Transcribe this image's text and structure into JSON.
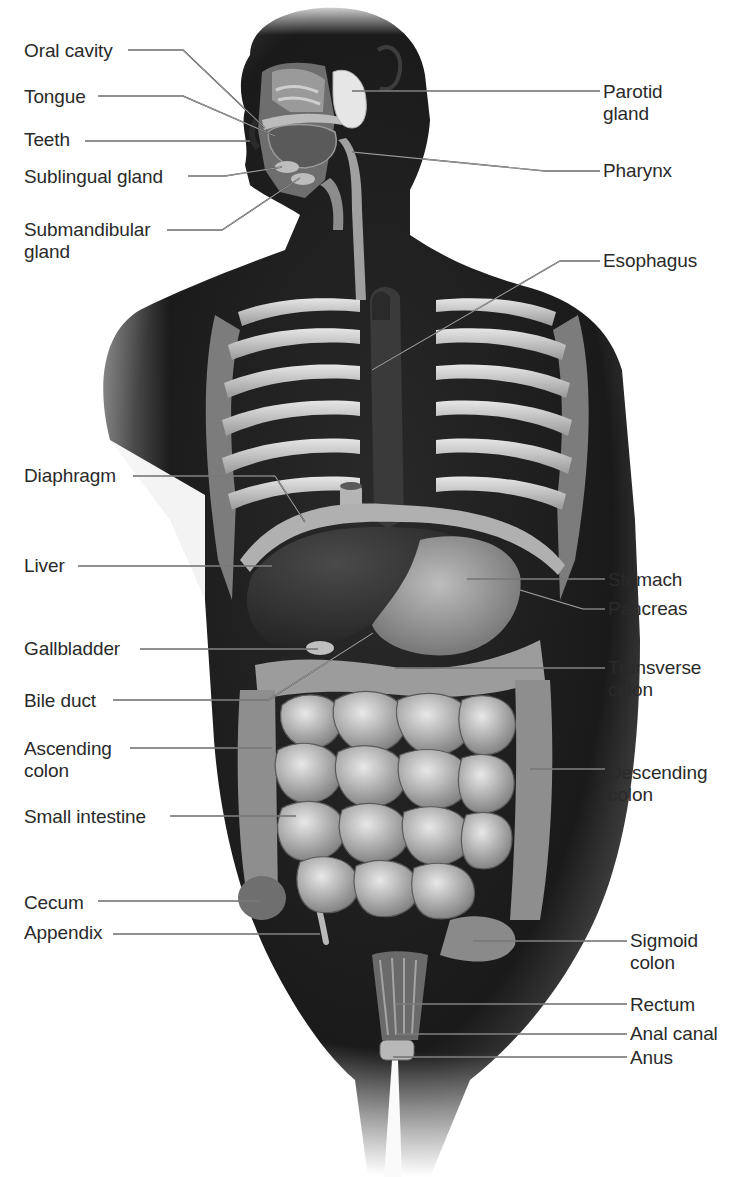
{
  "figure": {
    "colors": {
      "background": "#ffffff",
      "body": "#1c1c1c",
      "organ_light": "#c8c8c8",
      "organ_mid": "#8a8a8a",
      "label_text": "#2a2a2a",
      "leader": "#3a3a3a"
    }
  },
  "labels": [
    {
      "id": "oral-cavity",
      "text": "Oral cavity",
      "x": 24,
      "y": 40,
      "side": "left",
      "anchor": [
        128,
        50
      ],
      "path": [
        [
          128,
          50
        ],
        [
          183,
          50
        ],
        [
          265,
          128
        ]
      ]
    },
    {
      "id": "tongue",
      "text": "Tongue",
      "x": 24,
      "y": 86,
      "side": "left",
      "anchor": [
        98,
        96
      ],
      "path": [
        [
          98,
          96
        ],
        [
          183,
          96
        ],
        [
          275,
          136
        ]
      ]
    },
    {
      "id": "teeth",
      "text": "Teeth",
      "x": 24,
      "y": 129,
      "side": "left",
      "anchor": [
        85,
        141
      ],
      "path": [
        [
          85,
          141
        ],
        [
          250,
          141
        ]
      ]
    },
    {
      "id": "sublingual-gland",
      "text": "Sublingual gland",
      "x": 24,
      "y": 166,
      "side": "left",
      "anchor": [
        188,
        176
      ],
      "path": [
        [
          188,
          176
        ],
        [
          225,
          176
        ],
        [
          282,
          167
        ]
      ]
    },
    {
      "id": "submandibular-gland",
      "text": "Submandibular\ngland",
      "x": 24,
      "y": 219,
      "side": "left",
      "anchor": [
        167,
        230
      ],
      "path": [
        [
          167,
          230
        ],
        [
          222,
          230
        ],
        [
          300,
          178
        ]
      ]
    },
    {
      "id": "parotid-gland",
      "text": "Parotid\ngland",
      "x": 603,
      "y": 81,
      "side": "right",
      "anchor": [
        600,
        91
      ],
      "path": [
        [
          600,
          91
        ],
        [
          352,
          91
        ]
      ]
    },
    {
      "id": "pharynx",
      "text": "Pharynx",
      "x": 603,
      "y": 160,
      "side": "right",
      "anchor": [
        600,
        171
      ],
      "path": [
        [
          600,
          171
        ],
        [
          545,
          171
        ],
        [
          352,
          152
        ]
      ]
    },
    {
      "id": "esophagus",
      "text": "Esophagus",
      "x": 603,
      "y": 250,
      "side": "right",
      "anchor": [
        600,
        261
      ],
      "path": [
        [
          600,
          261
        ],
        [
          560,
          261
        ],
        [
          372,
          370
        ]
      ]
    },
    {
      "id": "diaphragm",
      "text": "Diaphragm",
      "x": 24,
      "y": 465,
      "side": "left",
      "anchor": [
        133,
        476
      ],
      "path": [
        [
          133,
          476
        ],
        [
          275,
          476
        ],
        [
          305,
          522
        ]
      ]
    },
    {
      "id": "liver",
      "text": "Liver",
      "x": 24,
      "y": 555,
      "side": "left",
      "anchor": [
        78,
        566
      ],
      "path": [
        [
          78,
          566
        ],
        [
          272,
          566
        ]
      ]
    },
    {
      "id": "stomach",
      "text": "Stomach",
      "x": 608,
      "y": 569,
      "side": "right",
      "anchor": [
        605,
        579
      ],
      "path": [
        [
          605,
          579
        ],
        [
          467,
          579
        ]
      ]
    },
    {
      "id": "pancreas",
      "text": "Pancreas",
      "x": 608,
      "y": 598,
      "side": "right",
      "anchor": [
        605,
        609
      ],
      "path": [
        [
          605,
          609
        ],
        [
          583,
          609
        ],
        [
          520,
          590
        ]
      ]
    },
    {
      "id": "gallbladder",
      "text": "Gallbladder",
      "x": 24,
      "y": 638,
      "side": "left",
      "anchor": [
        140,
        649
      ],
      "path": [
        [
          140,
          649
        ],
        [
          318,
          649
        ]
      ]
    },
    {
      "id": "bile-duct",
      "text": "Bile duct",
      "x": 24,
      "y": 690,
      "side": "left",
      "anchor": [
        113,
        700
      ],
      "path": [
        [
          113,
          700
        ],
        [
          268,
          700
        ],
        [
          373,
          633
        ]
      ]
    },
    {
      "id": "transverse-colon",
      "text": "Transverse\ncolon",
      "x": 608,
      "y": 657,
      "side": "right",
      "anchor": [
        605,
        668
      ],
      "path": [
        [
          605,
          668
        ],
        [
          395,
          668
        ]
      ]
    },
    {
      "id": "ascending-colon",
      "text": "Ascending\ncolon",
      "x": 24,
      "y": 738,
      "side": "left",
      "anchor": [
        130,
        748
      ],
      "path": [
        [
          130,
          748
        ],
        [
          272,
          748
        ]
      ]
    },
    {
      "id": "descending-colon",
      "text": "Descending\ncolon",
      "x": 608,
      "y": 762,
      "side": "right",
      "anchor": [
        605,
        769
      ],
      "path": [
        [
          605,
          769
        ],
        [
          530,
          769
        ]
      ]
    },
    {
      "id": "small-intestine",
      "text": "Small intestine",
      "x": 24,
      "y": 806,
      "side": "left",
      "anchor": [
        170,
        816
      ],
      "path": [
        [
          170,
          816
        ],
        [
          296,
          816
        ]
      ]
    },
    {
      "id": "cecum",
      "text": "Cecum",
      "x": 24,
      "y": 892,
      "side": "left",
      "anchor": [
        98,
        901
      ],
      "path": [
        [
          98,
          901
        ],
        [
          260,
          901
        ]
      ]
    },
    {
      "id": "appendix",
      "text": "Appendix",
      "x": 24,
      "y": 922,
      "side": "left",
      "anchor": [
        113,
        934
      ],
      "path": [
        [
          113,
          934
        ],
        [
          320,
          934
        ]
      ]
    },
    {
      "id": "sigmoid-colon",
      "text": "Sigmoid\ncolon",
      "x": 630,
      "y": 930,
      "side": "right",
      "anchor": [
        627,
        941
      ],
      "path": [
        [
          627,
          941
        ],
        [
          473,
          941
        ]
      ]
    },
    {
      "id": "rectum",
      "text": "Rectum",
      "x": 630,
      "y": 994,
      "side": "right",
      "anchor": [
        627,
        1004
      ],
      "path": [
        [
          627,
          1004
        ],
        [
          395,
          1004
        ]
      ]
    },
    {
      "id": "anal-canal",
      "text": "Anal canal",
      "x": 630,
      "y": 1023,
      "side": "right",
      "anchor": [
        627,
        1034
      ],
      "path": [
        [
          627,
          1034
        ],
        [
          396,
          1034
        ]
      ]
    },
    {
      "id": "anus",
      "text": "Anus",
      "x": 630,
      "y": 1047,
      "side": "right",
      "anchor": [
        627,
        1057
      ],
      "path": [
        [
          627,
          1057
        ],
        [
          393,
          1057
        ]
      ]
    }
  ]
}
